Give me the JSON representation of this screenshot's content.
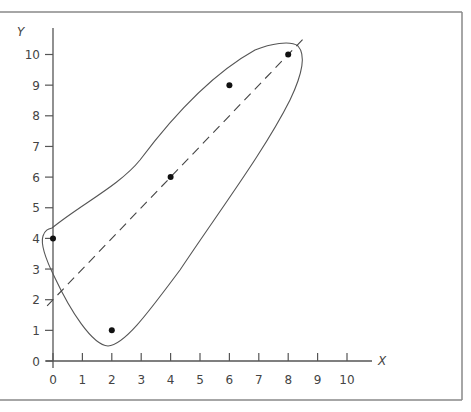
{
  "chart_data": {
    "type": "scatter",
    "title": "",
    "xlabel": "X",
    "ylabel": "Y",
    "xlim": [
      0,
      10
    ],
    "ylim": [
      0,
      10
    ],
    "x_ticks": [
      "0",
      "1",
      "2",
      "3",
      "4",
      "5",
      "6",
      "7",
      "8",
      "9",
      "10"
    ],
    "y_ticks": [
      "0",
      "1",
      "2",
      "3",
      "4",
      "5",
      "6",
      "7",
      "8",
      "9",
      "10"
    ],
    "grid": false,
    "legend": null,
    "series": [
      {
        "name": "points",
        "x": [
          0,
          2,
          4,
          6,
          8
        ],
        "y": [
          4,
          1,
          6,
          9,
          10
        ]
      }
    ],
    "fit_line": {
      "style": "dashed",
      "equation": "y = x + 2",
      "x_range": [
        -0.2,
        8.5
      ]
    },
    "annotations": [
      "Closed freehand curve enclosing all data points"
    ]
  },
  "colors": {
    "axis": "#555555",
    "points": "#111111",
    "curve": "#555555",
    "frame": "#888888"
  }
}
